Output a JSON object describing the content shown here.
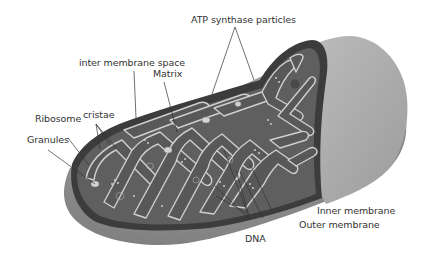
{
  "diagram": {
    "colors": {
      "background": "#ffffff",
      "outer_surface": "#9a9a9a",
      "outer_surface_light": "#b8b8b8",
      "inter_space": "#3a3a3a",
      "matrix": "#5e5e5e",
      "cristae_outline": "#c8c8c8",
      "leader_line": "#333333",
      "label_text": "#333333"
    },
    "labels": [
      {
        "id": "atp",
        "text": "ATP synthase particles"
      },
      {
        "id": "ims",
        "text": "inter membrane space"
      },
      {
        "id": "matrix",
        "text": "Matrix"
      },
      {
        "id": "cristae",
        "text": "cristae"
      },
      {
        "id": "ribosome",
        "text": "Ribosome"
      },
      {
        "id": "granules",
        "text": "Granules"
      },
      {
        "id": "inner",
        "text": "Inner membrane"
      },
      {
        "id": "outer",
        "text": "Outer membrane"
      },
      {
        "id": "dna",
        "text": "DNA"
      }
    ]
  }
}
